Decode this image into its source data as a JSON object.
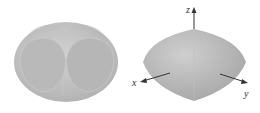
{
  "figures": [
    {
      "name": "intersecting-cylinders-solid",
      "description": "three intersecting cylinders shaded surface"
    },
    {
      "name": "intersection-solid-with-axes",
      "axes": {
        "x": "x",
        "y": "y",
        "z": "z"
      }
    }
  ],
  "colors": {
    "surface": "#bdbdbd",
    "surface_light": "#d6d6d6",
    "surface_dark": "#a9a9a9",
    "axis": "#333333"
  }
}
